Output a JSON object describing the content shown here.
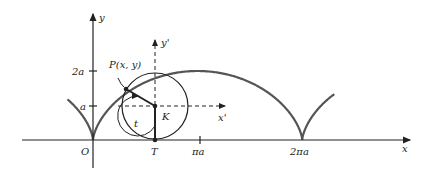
{
  "figure": {
    "labels": {
      "y_axis": "y",
      "x_axis": "x",
      "y_prime": "y'",
      "x_prime": "x'",
      "origin": "O",
      "point_P": "P(x, y)",
      "center_K": "K",
      "contact_T": "T",
      "angle_t": "t",
      "tick_2a": "2a",
      "tick_a": "a",
      "tick_pi_a": "πa",
      "tick_2pi_a": "2πa"
    },
    "colors": {
      "curve": "#555555",
      "axes": "#222222",
      "circle": "#222222"
    }
  }
}
